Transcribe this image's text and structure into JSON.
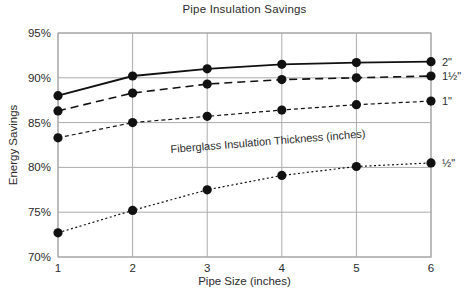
{
  "chart_data": {
    "type": "line",
    "title": "Pipe Insulation Savings",
    "xlabel": "Pipe Size (inches)",
    "ylabel": "Energy Savings",
    "annotation": "Fiberglass Insulation Thickness (inches)",
    "x": [
      1,
      2,
      3,
      4,
      5,
      6
    ],
    "xlim": [
      1,
      6
    ],
    "ylim": [
      70,
      95
    ],
    "y_ticks": [
      95,
      90,
      85,
      80,
      75,
      70
    ],
    "y_tick_suffix": "%",
    "grid": true,
    "marker": "filled-circle",
    "legend_position": "right-of-line-ends",
    "series": [
      {
        "name": "2\"",
        "values": [
          88.0,
          90.2,
          91.0,
          91.5,
          91.7,
          91.8
        ],
        "line_style": "solid",
        "color": "#111111"
      },
      {
        "name": "1½\"",
        "values": [
          86.3,
          88.3,
          89.3,
          89.8,
          90.0,
          90.2
        ],
        "line_style": "long-dash",
        "color": "#111111"
      },
      {
        "name": "1\"",
        "values": [
          83.3,
          85.0,
          85.7,
          86.4,
          87.0,
          87.4
        ],
        "line_style": "dash",
        "color": "#111111"
      },
      {
        "name": "½\"",
        "values": [
          72.7,
          75.2,
          77.5,
          79.1,
          80.1,
          80.5
        ],
        "line_style": "dot",
        "color": "#111111"
      }
    ]
  },
  "colors": {
    "background": "#ffffff",
    "grid": "#ababab",
    "text": "#2b2b2b",
    "line": "#111111"
  }
}
